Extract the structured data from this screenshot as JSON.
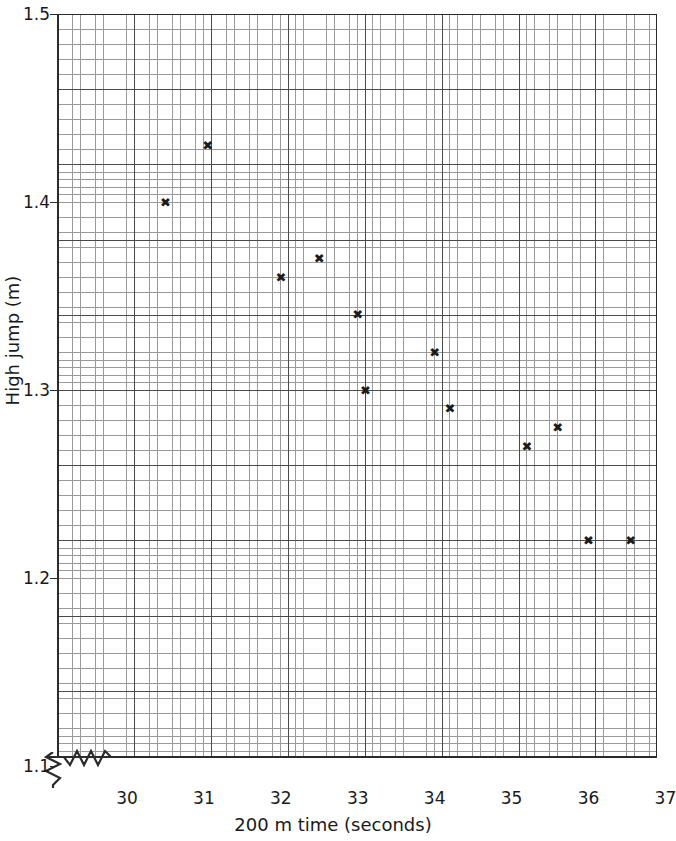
{
  "chart_data": {
    "type": "scatter",
    "title": "",
    "xlabel": "200 m time (seconds)",
    "ylabel": "High jump (m)",
    "xlim": [
      29.5,
      37
    ],
    "ylim": [
      1.09,
      1.5
    ],
    "xticks": [
      30,
      31,
      32,
      33,
      34,
      35,
      36,
      37
    ],
    "yticks": [
      1.1,
      1.2,
      1.3,
      1.4,
      1.5
    ],
    "xtick_labels": [
      "30",
      "31",
      "32",
      "33",
      "34",
      "35",
      "36",
      "37"
    ],
    "ytick_labels": [
      "1.1",
      "1.2",
      "1.3",
      "1.4",
      "1.5"
    ],
    "grid": true,
    "grid_minor": true,
    "legend": "none",
    "axis_break_x": true,
    "axis_break_y": true,
    "marker": "x",
    "marker_color": "#1b1b1b",
    "points": [
      {
        "x": 30.5,
        "y": 1.4
      },
      {
        "x": 31.05,
        "y": 1.43
      },
      {
        "x": 32.0,
        "y": 1.36
      },
      {
        "x": 32.5,
        "y": 1.37
      },
      {
        "x": 33.0,
        "y": 1.34
      },
      {
        "x": 33.1,
        "y": 1.3
      },
      {
        "x": 34.0,
        "y": 1.32
      },
      {
        "x": 34.2,
        "y": 1.29
      },
      {
        "x": 35.2,
        "y": 1.27
      },
      {
        "x": 35.6,
        "y": 1.28
      },
      {
        "x": 36.0,
        "y": 1.22
      },
      {
        "x": 36.55,
        "y": 1.22
      }
    ]
  },
  "marker_glyph": "✖"
}
